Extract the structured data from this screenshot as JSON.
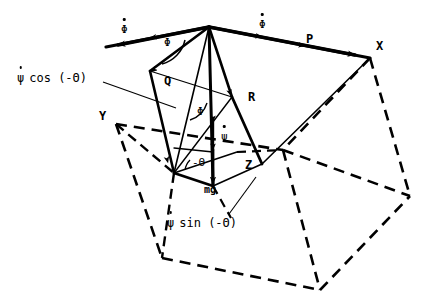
{
  "figure": {
    "type": "mechanics-vector-diagram",
    "background_color": "#ffffff",
    "line_color": "#000000"
  },
  "vertices": [
    {
      "id": "apex",
      "name": "apex-point",
      "x": 209,
      "y": 27
    },
    {
      "id": "X",
      "name": "vertex-x",
      "x": 370,
      "y": 58
    },
    {
      "id": "Y",
      "name": "vertex-y",
      "x": 116,
      "y": 124
    },
    {
      "id": "Z",
      "name": "vertex-z",
      "x": 262,
      "y": 164
    },
    {
      "id": "left_tip",
      "name": "left-arrow-tip",
      "x": 106,
      "y": 47
    },
    {
      "id": "base_left",
      "name": "base-left-corner",
      "x": 174,
      "y": 173
    },
    {
      "id": "base_bottom",
      "name": "base-bottom-corner",
      "x": 213,
      "y": 186
    },
    {
      "id": "hidden_center",
      "name": "hidden-center-vertex",
      "x": 283,
      "y": 150
    },
    {
      "id": "box_bl",
      "name": "box-bottom-left",
      "x": 162,
      "y": 258
    },
    {
      "id": "box_bc",
      "name": "box-bottom-center",
      "x": 320,
      "y": 290
    },
    {
      "id": "box_br",
      "name": "box-bottom-right",
      "x": 410,
      "y": 196
    }
  ],
  "labels": {
    "vertex_x": "X",
    "vertex_y": "Y",
    "vertex_z": "Z",
    "vector_p": "P",
    "vector_q": "Q",
    "vector_r": "R",
    "weight": "mg",
    "phi_angle_upper": "Φ",
    "phi_angle_lower": "Φ",
    "theta_angle": "-Θ",
    "phi_dot_left": "Φ",
    "phi_dot_top": "Φ",
    "psi_dot_center": "ψ",
    "psi_cos_expr": {
      "symbol": "ψ",
      "rest": "cos (-Θ)"
    },
    "psi_sin_expr": {
      "symbol": "ψ",
      "rest": "sin (-Θ)"
    }
  },
  "label_positions": {
    "vertex_x": {
      "x": 376,
      "y": 46
    },
    "vertex_y": {
      "x": 100,
      "y": 116
    },
    "vertex_z": {
      "x": 246,
      "y": 165
    },
    "vector_p": {
      "x": 307,
      "y": 39
    },
    "vector_q": {
      "x": 165,
      "y": 81
    },
    "vector_r": {
      "x": 249,
      "y": 97
    },
    "weight": {
      "x": 205,
      "y": 187
    },
    "phi_angle_upper": {
      "x": 165,
      "y": 43
    },
    "phi_angle_lower": {
      "x": 198,
      "y": 112
    },
    "theta_angle": {
      "x": 193,
      "y": 162
    },
    "phi_dot_left": {
      "x": 123,
      "y": 29
    },
    "phi_dot_top": {
      "x": 261,
      "y": 24
    },
    "psi_dot_center": {
      "x": 222,
      "y": 136
    },
    "psi_cos_expr": {
      "x": 18,
      "y": 79
    },
    "psi_sin_expr": {
      "x": 168,
      "y": 224
    }
  },
  "leader_lines": [
    {
      "name": "psi-cos-leader",
      "x1": 103,
      "y1": 82,
      "x2": 176,
      "y2": 108
    },
    {
      "name": "psi-sin-leader",
      "x1": 229,
      "y1": 215,
      "x2": 255,
      "y2": 178
    }
  ],
  "solid_edges": [
    {
      "name": "apex-to-x-edge",
      "points": "209,27 370,58"
    },
    {
      "name": "apex-to-left-tip-edge",
      "points": "209,27 106,47"
    },
    {
      "name": "x-to-z-hidden-edge",
      "points": "370,58 262,164"
    },
    {
      "name": "apex-to-q-edge",
      "points": "209,27 150,71 174,173"
    },
    {
      "name": "apex-to-base-left",
      "points": "209,27 174,173"
    },
    {
      "name": "apex-to-base-bottom",
      "points": "209,27 213,186"
    },
    {
      "name": "apex-to-r-edge",
      "points": "209,27 232,97 262,164"
    },
    {
      "name": "base-quad",
      "points": "174,173 213,186 262,164 232,97"
    },
    {
      "name": "inner-left-line",
      "points": "150,71 174,173"
    },
    {
      "name": "theta-base-line",
      "points": "174,173 213,186"
    }
  ],
  "dashed_edges": [
    {
      "name": "y-to-hidden-dash",
      "points": "116,124 283,150"
    },
    {
      "name": "x-to-hidden-dash",
      "points": "370,58 283,150"
    },
    {
      "name": "hidden-to-right-dash",
      "points": "283,150 410,196"
    },
    {
      "name": "hidden-to-bottom-dash",
      "points": "283,150 320,290"
    },
    {
      "name": "y-to-boxbl-dash",
      "points": "116,124 162,258"
    },
    {
      "name": "boxbl-to-boxbc-dash",
      "points": "162,258 320,290"
    },
    {
      "name": "boxbc-to-boxbr-dash",
      "points": "320,290 410,196"
    },
    {
      "name": "x-to-boxbr-dash",
      "points": "370,58 410,196"
    },
    {
      "name": "y-to-baseleft-dash",
      "points": "116,124 174,173"
    },
    {
      "name": "baseleft-to-boxbl-dash",
      "points": "174,173 162,258"
    },
    {
      "name": "basebottom-down-dash",
      "points": "213,186 230,216"
    }
  ],
  "arrows": [
    {
      "name": "phi-dot-left-arrow",
      "x1": 209,
      "y1": 27,
      "x2": 106,
      "y2": 47,
      "mid": true
    },
    {
      "name": "p-vector-arrow",
      "x1": 209,
      "y1": 27,
      "x2": 370,
      "y2": 58,
      "mid": true
    },
    {
      "name": "q-vector-arrow",
      "x1": 209,
      "y1": 27,
      "x2": 174,
      "y2": 173,
      "mid": true
    },
    {
      "name": "r-vector-arrow",
      "x1": 209,
      "y1": 27,
      "x2": 262,
      "y2": 164,
      "mid": true
    },
    {
      "name": "mg-vector-arrow",
      "x1": 213,
      "y1": 120,
      "x2": 213,
      "y2": 186,
      "mid": false
    },
    {
      "name": "psi-dot-down-arrow",
      "x1": 213,
      "y1": 120,
      "x2": 213,
      "y2": 152,
      "mid": false
    }
  ]
}
